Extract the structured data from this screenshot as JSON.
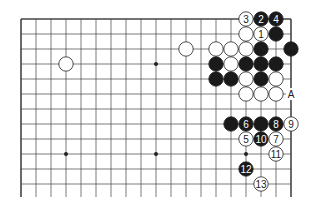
{
  "board": {
    "origin_x": 21,
    "origin_y": 19,
    "spacing": 15,
    "cols": 19,
    "rows_visible": 12,
    "line_extend_bottom": 13,
    "star_points": [
      [
        3,
        3
      ],
      [
        9,
        3
      ],
      [
        3,
        9
      ],
      [
        9,
        9
      ],
      [
        15,
        9
      ]
    ]
  },
  "stones": [
    {
      "c": 3,
      "r": 3,
      "color": "white"
    },
    {
      "c": 11,
      "r": 2,
      "color": "white"
    },
    {
      "c": 15,
      "r": 0,
      "color": "white",
      "label": "3"
    },
    {
      "c": 16,
      "r": 0,
      "color": "black",
      "label": "2"
    },
    {
      "c": 17,
      "r": 0,
      "color": "black",
      "label": "4"
    },
    {
      "c": 15,
      "r": 1,
      "color": "white"
    },
    {
      "c": 16,
      "r": 1,
      "color": "white",
      "label": "1"
    },
    {
      "c": 17,
      "r": 1,
      "color": "black"
    },
    {
      "c": 13,
      "r": 2,
      "color": "white"
    },
    {
      "c": 14,
      "r": 2,
      "color": "white"
    },
    {
      "c": 15,
      "r": 2,
      "color": "white"
    },
    {
      "c": 16,
      "r": 2,
      "color": "black"
    },
    {
      "c": 18,
      "r": 2,
      "color": "black"
    },
    {
      "c": 13,
      "r": 3,
      "color": "black"
    },
    {
      "c": 14,
      "r": 3,
      "color": "white"
    },
    {
      "c": 15,
      "r": 3,
      "color": "black"
    },
    {
      "c": 16,
      "r": 3,
      "color": "black"
    },
    {
      "c": 17,
      "r": 3,
      "color": "black"
    },
    {
      "c": 13,
      "r": 4,
      "color": "black"
    },
    {
      "c": 14,
      "r": 4,
      "color": "black"
    },
    {
      "c": 15,
      "r": 4,
      "color": "white"
    },
    {
      "c": 16,
      "r": 4,
      "color": "black"
    },
    {
      "c": 17,
      "r": 4,
      "color": "white"
    },
    {
      "c": 15,
      "r": 5,
      "color": "white"
    },
    {
      "c": 16,
      "r": 5,
      "color": "white"
    },
    {
      "c": 17,
      "r": 5,
      "color": "white"
    },
    {
      "c": 14,
      "r": 7,
      "color": "black"
    },
    {
      "c": 15,
      "r": 7,
      "color": "black",
      "label": "6"
    },
    {
      "c": 16,
      "r": 7,
      "color": "black"
    },
    {
      "c": 17,
      "r": 7,
      "color": "black",
      "label": "8"
    },
    {
      "c": 18,
      "r": 7,
      "color": "white",
      "label": "9"
    },
    {
      "c": 15,
      "r": 8,
      "color": "white",
      "label": "5"
    },
    {
      "c": 16,
      "r": 8,
      "color": "black",
      "label": "10"
    },
    {
      "c": 17,
      "r": 8,
      "color": "white",
      "label": "7"
    },
    {
      "c": 17,
      "r": 9,
      "color": "white",
      "label": "11"
    },
    {
      "c": 15,
      "r": 10,
      "color": "black",
      "label": "12"
    },
    {
      "c": 16,
      "r": 11,
      "color": "white",
      "label": "13"
    }
  ],
  "markers": [
    {
      "c": 18,
      "r": 5,
      "text": "A"
    }
  ]
}
